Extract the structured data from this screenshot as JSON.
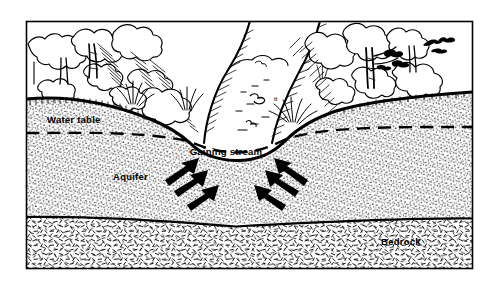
{
  "figure": {
    "kind": "cross-section-diagram",
    "style": "black-and-white pen-and-ink line drawing with stipple shading",
    "frame": {
      "x": 26,
      "y": 21,
      "width": 447,
      "height": 248,
      "border_color": "#000000"
    },
    "background_color": "#ffffff",
    "ink_color": "#000000"
  },
  "labels": {
    "water_table": "Water table",
    "gaining_stream": "Gaining stream",
    "aquifer": "Aquifer",
    "bedrock": "Bedrock"
  },
  "label_positions": {
    "water_table": {
      "x": 47,
      "y": 123
    },
    "gaining_stream": {
      "x": 226,
      "y": 155
    },
    "aquifer": {
      "x": 113,
      "y": 180
    },
    "bedrock": {
      "x": 381,
      "y": 245
    }
  },
  "layers": [
    {
      "name": "sky-and-vegetation",
      "fill": "#ffffff",
      "note": "trees, shrubs, grass above ground surface"
    },
    {
      "name": "aquifer",
      "fill": "stipple-dense",
      "note": "saturated and unsaturated granular material"
    },
    {
      "name": "bedrock",
      "fill": "dash-hatch",
      "note": "fractured rock beneath aquifer"
    }
  ],
  "lines": {
    "ground_surface": {
      "name": "ground-surface-line",
      "weight": "heavy",
      "style": "solid"
    },
    "water_table": {
      "name": "water-table-line",
      "weight": "medium",
      "style": "dashed"
    },
    "bedrock_contact": {
      "name": "bedrock-contact-line",
      "weight": "medium",
      "style": "solid"
    }
  },
  "flow_arrows": {
    "count": 6,
    "description": "groundwater flow arrows converging upward into the stream channel",
    "left_group": 3,
    "right_group": 3,
    "color": "#000000"
  },
  "scene_elements": {
    "trees_left": 4,
    "trees_right": 3,
    "grass_tufts": 4,
    "bird": 1,
    "stream_channel": "U-shaped channel incised below the water table"
  },
  "colors": {
    "ink": "#000000",
    "paper": "#ffffff",
    "stipple": "#1a1a1a"
  }
}
